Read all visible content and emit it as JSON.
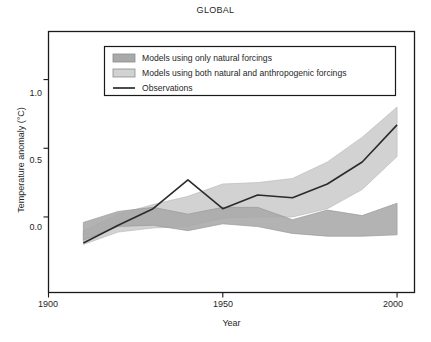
{
  "chart_data": {
    "type": "area",
    "title": "GLOBAL",
    "xlabel": "Year",
    "ylabel": "Temperature anomaly (°C)",
    "xlim": [
      1900,
      2005
    ],
    "ylim": [
      -0.55,
      1.35
    ],
    "xticks": [
      1900,
      1950,
      2000
    ],
    "xtick_labels": [
      "1900",
      "1950",
      "2000"
    ],
    "yticks": [
      0.0,
      0.5,
      1.0
    ],
    "ytick_labels": [
      "0.0",
      "0.5",
      "1.0"
    ],
    "grid": false,
    "legend_position": "upper-left-inside",
    "colors": {
      "natural_band": "#a9a9a9",
      "anthropogenic_band": "#d2d2d2",
      "observations_line": "#2b2b2b",
      "frame": "#1a1a1a",
      "background": "#ffffff"
    },
    "x": [
      1910,
      1920,
      1930,
      1940,
      1950,
      1960,
      1970,
      1980,
      1990,
      2000
    ],
    "series": [
      {
        "name": "Models using only natural forcings",
        "type": "band",
        "color": "#a9a9a9",
        "lower": [
          -0.17,
          -0.07,
          -0.06,
          -0.1,
          -0.05,
          -0.07,
          -0.12,
          -0.14,
          -0.14,
          -0.13
        ],
        "upper": [
          -0.04,
          0.04,
          0.07,
          0.02,
          0.07,
          0.07,
          -0.02,
          0.05,
          0.01,
          0.1
        ]
      },
      {
        "name": "Models using both natural and anthropogenic forcings",
        "type": "band",
        "color": "#d2d2d2",
        "lower": [
          -0.2,
          -0.11,
          -0.08,
          -0.07,
          -0.01,
          0.0,
          0.0,
          0.06,
          0.2,
          0.44
        ],
        "upper": [
          -0.1,
          0.02,
          0.09,
          0.15,
          0.24,
          0.25,
          0.28,
          0.4,
          0.58,
          0.8
        ]
      },
      {
        "name": "Observations",
        "type": "line",
        "color": "#2b2b2b",
        "values": [
          -0.19,
          -0.06,
          0.06,
          0.27,
          0.06,
          0.16,
          0.14,
          0.24,
          0.4,
          0.67
        ]
      }
    ],
    "legend": [
      {
        "label": "Models using only natural forcings",
        "marker": "swatch",
        "color": "#a9a9a9"
      },
      {
        "label": "Models using both natural and anthropogenic forcings",
        "marker": "swatch",
        "color": "#d2d2d2"
      },
      {
        "label": "Observations",
        "marker": "line",
        "color": "#2b2b2b"
      }
    ]
  }
}
